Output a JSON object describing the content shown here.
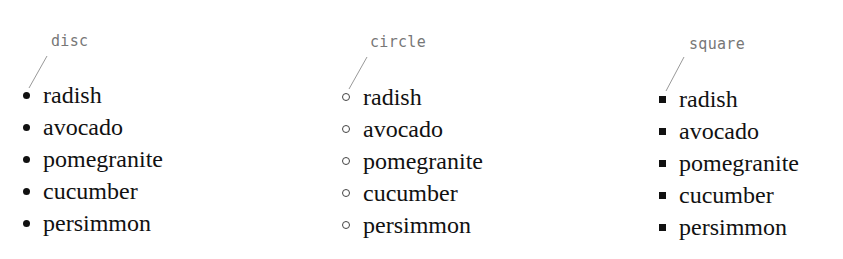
{
  "groups": [
    {
      "style": "disc",
      "label": "disc",
      "items": [
        "radish",
        "avocado",
        "pomegranite",
        "cucumber",
        "persimmon"
      ]
    },
    {
      "style": "circle",
      "label": "circle",
      "items": [
        "radish",
        "avocado",
        "pomegranite",
        "cucumber",
        "persimmon"
      ]
    },
    {
      "style": "square",
      "label": "square",
      "items": [
        "radish",
        "avocado",
        "pomegranite",
        "cucumber",
        "persimmon"
      ]
    }
  ],
  "colors": {
    "text": "#111111",
    "label": "#777777",
    "leader": "#999999",
    "background": "#ffffff"
  }
}
